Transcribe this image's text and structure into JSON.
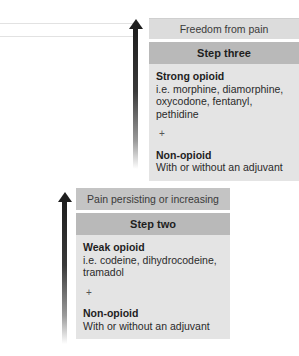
{
  "diagram": {
    "type": "analgesic-ladder",
    "steps": [
      {
        "id": "step3",
        "outcome": "Freedom from pain",
        "title": "Step three",
        "opioid_label": "Strong opioid",
        "opioid_examples": "i.e. morphine, diamorphine, oxycodone, fentanyl, pethidine",
        "plus": "+",
        "nonopioid_label": "Non-opioid",
        "nonopioid_note": "With or without an adjuvant"
      },
      {
        "id": "step2",
        "outcome": "Pain persisting or increasing",
        "title": "Step two",
        "opioid_label": "Weak opioid",
        "opioid_examples": "i.e. codeine, dihydrocodeine, tramadol",
        "plus": "+",
        "nonopioid_label": "Non-opioid",
        "nonopioid_note": "With or without an adjuvant"
      }
    ],
    "colors": {
      "arrow": "#1e1e1e",
      "header": "#b9b9b9",
      "outcome_step3": "#dcdcdc",
      "outcome_step2": "#c4c4c4",
      "body": "#e4e4e4"
    }
  }
}
